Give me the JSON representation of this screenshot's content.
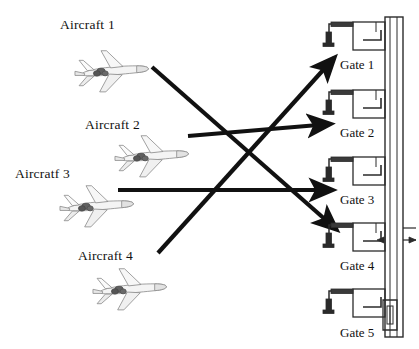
{
  "figure": {
    "background_color": "#ffffff",
    "ink_color": "#111111",
    "plane_color": "#9a9a9a"
  },
  "aircraft": [
    {
      "id": "aircraft-1",
      "label": "Aircraft 1",
      "label_x": 60,
      "label_y": 17,
      "plane_x": 70,
      "plane_y": 48,
      "plane_w": 84,
      "plane_h": 48
    },
    {
      "id": "aircraft-2",
      "label": "Aircraft 2",
      "label_x": 85,
      "label_y": 117,
      "plane_x": 110,
      "plane_y": 133,
      "plane_w": 84,
      "plane_h": 48
    },
    {
      "id": "aircraft-3",
      "label": "Aircratf 3",
      "label_x": 15,
      "label_y": 166,
      "plane_x": 55,
      "plane_y": 183,
      "plane_w": 84,
      "plane_h": 48
    },
    {
      "id": "aircraft-4",
      "label": "Aircraft 4",
      "label_x": 78,
      "label_y": 248,
      "plane_x": 88,
      "plane_y": 266,
      "plane_w": 84,
      "plane_h": 48
    }
  ],
  "gates": [
    {
      "id": "gate-1",
      "label": "Gate 1",
      "label_x": 340,
      "label_y": 57,
      "stand_y": 22
    },
    {
      "id": "gate-2",
      "label": "Gate 2",
      "label_x": 340,
      "label_y": 125,
      "stand_y": 90
    },
    {
      "id": "gate-3",
      "label": "Gate 3",
      "label_x": 340,
      "label_y": 192,
      "stand_y": 157
    },
    {
      "id": "gate-4",
      "label": "Gate 4",
      "label_x": 340,
      "label_y": 258,
      "stand_y": 223
    },
    {
      "id": "gate-5",
      "label": "Gate 5",
      "label_x": 340,
      "label_y": 325,
      "stand_y": 289
    }
  ],
  "assignments": [
    {
      "id": "assignment-aircraft1-gate4",
      "from": "Aircraft 1",
      "to": "Gate 4",
      "x1": 152,
      "y1": 67,
      "x2": 336,
      "y2": 229
    },
    {
      "id": "assignment-aircraft2-gate2",
      "from": "Aircraft 2",
      "to": "Gate 2",
      "x1": 188,
      "y1": 136,
      "x2": 330,
      "y2": 124
    },
    {
      "id": "assignment-aircraft3-gate3",
      "from": "Aircratf 3",
      "to": "Gate 3",
      "x1": 118,
      "y1": 190,
      "x2": 332,
      "y2": 190
    },
    {
      "id": "assignment-aircraft4-gate1",
      "from": "Aircraft 4",
      "to": "Gate 1",
      "x1": 158,
      "y1": 253,
      "x2": 334,
      "y2": 58
    }
  ],
  "terminal": {
    "id": "terminal-building",
    "concourse_x": 385,
    "concourse_top": 17,
    "concourse_bottom": 337
  }
}
